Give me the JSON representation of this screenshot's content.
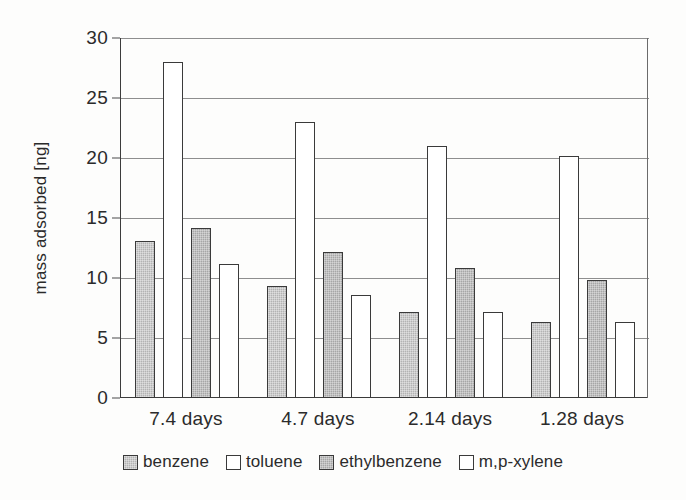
{
  "chart_data": {
    "type": "bar",
    "title": "",
    "subtitle": "",
    "xlabel": "",
    "ylabel": "mass adsorbed [ng]",
    "categories": [
      "7.4 days",
      "4.7 days",
      "2.14 days",
      "1.28 days"
    ],
    "series": [
      {
        "name": "benzene",
        "values": [
          13.1,
          9.3,
          7.2,
          6.3
        ],
        "fill": "fill-gray-light",
        "color": "#b3b3b3"
      },
      {
        "name": "toluene",
        "values": [
          28.0,
          23.0,
          21.0,
          20.2
        ],
        "fill": "fill-white",
        "color": "#ffffff"
      },
      {
        "name": "ethylbenzene",
        "values": [
          14.2,
          12.2,
          10.8,
          9.8
        ],
        "fill": "fill-gray-dark",
        "color": "#a6a6a6"
      },
      {
        "name": "m,p-xylene",
        "values": [
          11.2,
          8.6,
          7.2,
          6.3
        ],
        "fill": "fill-white",
        "color": "#ffffff"
      }
    ],
    "ylim": [
      0,
      30
    ],
    "yticks": [
      0,
      5,
      10,
      15,
      20,
      25,
      30
    ],
    "ytick_labels": [
      "0",
      "5",
      "10",
      "15",
      "20",
      "25",
      "30"
    ],
    "grid": true,
    "grid_axis": "y",
    "legend_position": "bottom",
    "axis_color": "#3c3c3c",
    "grid_color": "#8e8e8e",
    "text_color": "#2b2b2b",
    "background": "#fdfdfc"
  }
}
